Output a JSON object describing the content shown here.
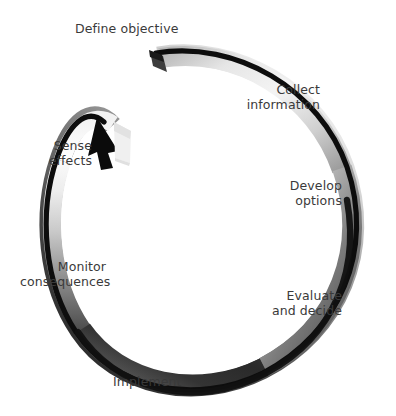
{
  "diagram": {
    "type": "cyclic-process-loop",
    "direction": "clockwise",
    "background_color": "#ffffff",
    "text_color": "#3a3a3a",
    "ribbon": {
      "dark_color": "#0d0d0d",
      "mid_color": "#6e6e6e",
      "light_color": "#e8e8e8",
      "shape": "open ellipse ribbon with arrowhead",
      "gap_position": "top-left"
    },
    "steps": [
      {
        "id": "define-objective",
        "order": 1,
        "lines": [
          "Define objective"
        ],
        "align": "left"
      },
      {
        "id": "collect-information",
        "order": 2,
        "lines": [
          "Collect",
          "information"
        ],
        "align": "right"
      },
      {
        "id": "develop-options",
        "order": 3,
        "lines": [
          "Develop",
          "options"
        ],
        "align": "right"
      },
      {
        "id": "evaluate-and-decide",
        "order": 4,
        "lines": [
          "Evaluate",
          "and decide"
        ],
        "align": "right"
      },
      {
        "id": "implement",
        "order": 5,
        "lines": [
          "Implement"
        ],
        "align": "center"
      },
      {
        "id": "monitor-consequences",
        "order": 6,
        "lines": [
          "Monitor",
          "consequences"
        ],
        "align": "right"
      },
      {
        "id": "sense-effects",
        "order": 7,
        "lines": [
          "Sense",
          "effects"
        ],
        "align": "right"
      }
    ]
  }
}
